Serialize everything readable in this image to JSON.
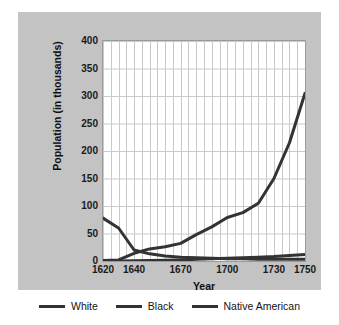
{
  "chart_data": {
    "type": "line",
    "title": "",
    "xlabel": "Year",
    "ylabel": "Population (in thousands)",
    "xlim": [
      1620,
      1750
    ],
    "ylim": [
      0,
      400
    ],
    "grid": true,
    "grid_x_step": 5,
    "grid_y_step": 50,
    "legend_position": "bottom",
    "xticks": [
      1620,
      1640,
      1670,
      1700,
      1730,
      1750
    ],
    "yticks": [
      0,
      50,
      100,
      150,
      200,
      250,
      300,
      350,
      400
    ],
    "series": [
      {
        "name": "White",
        "color": "#333333",
        "x": [
          1620,
          1630,
          1640,
          1650,
          1660,
          1670,
          1680,
          1690,
          1700,
          1710,
          1720,
          1730,
          1740,
          1750
        ],
        "values": [
          1,
          2,
          14,
          22,
          26,
          32,
          48,
          62,
          79,
          88,
          105,
          150,
          215,
          305
        ]
      },
      {
        "name": "Black",
        "color": "#333333",
        "x": [
          1620,
          1630,
          1640,
          1650,
          1660,
          1670,
          1680,
          1690,
          1700,
          1710,
          1720,
          1730,
          1740,
          1750
        ],
        "values": [
          0,
          0,
          0.6,
          1,
          1.5,
          2,
          3,
          4,
          5,
          6,
          7,
          8,
          10,
          12
        ]
      },
      {
        "name": "Native American",
        "color": "#333333",
        "x": [
          1620,
          1630,
          1640,
          1650,
          1660,
          1670,
          1680,
          1690,
          1700,
          1710,
          1720,
          1730,
          1740,
          1750
        ],
        "values": [
          78,
          60,
          20,
          13,
          9,
          7,
          6,
          5,
          4,
          4,
          3,
          3,
          3,
          3
        ]
      }
    ]
  },
  "axes": {
    "x_title": "Year",
    "y_title": "Population (in thousands)",
    "x_tick_labels": [
      "1620",
      "1640",
      "1670",
      "1700",
      "1730",
      "1750"
    ],
    "y_tick_labels": [
      "0",
      "50",
      "100",
      "150",
      "200",
      "250",
      "300",
      "350",
      "400"
    ]
  },
  "legend": {
    "items": [
      {
        "label": "White"
      },
      {
        "label": "Black"
      },
      {
        "label": "Native American"
      }
    ]
  },
  "colors": {
    "panel_background": "#c3c3c3",
    "plot_background": "#ffffff",
    "grid": "#c9c9c9",
    "frame": "#9a9a9a",
    "line": "#333333",
    "text": "#121212"
  }
}
